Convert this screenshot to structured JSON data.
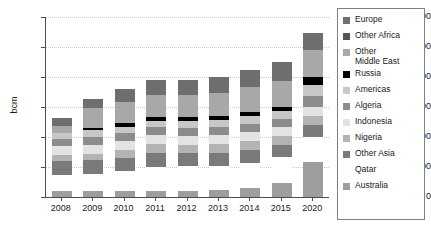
{
  "chart_data": {
    "type": "bar",
    "title": "",
    "xlabel": "",
    "ylabel": "bcm",
    "ylim": [
      0,
      600
    ],
    "ytick_values": [
      0,
      100,
      200,
      300,
      400,
      500,
      600
    ],
    "ytick_labels": [
      "0",
      "100",
      "200",
      "300",
      "400",
      "500",
      "600"
    ],
    "grid": true,
    "stacked": true,
    "legend_position": "right",
    "categories": [
      "2008",
      "2009",
      "2010",
      "2011",
      "2012",
      "2013",
      "2014",
      "2015",
      "2020"
    ],
    "series": [
      {
        "name": "Australia",
        "color": "#9e9e9e",
        "values": [
          20,
          20,
          20,
          20,
          20,
          22,
          30,
          48,
          116
        ]
      },
      {
        "name": "Qatar",
        "color": "#ffffff",
        "values": [
          55,
          58,
          66,
          80,
          82,
          82,
          84,
          84,
          84
        ]
      },
      {
        "name": "Other Asia",
        "color": "#7a7a7a",
        "values": [
          44,
          44,
          45,
          46,
          45,
          44,
          42,
          40,
          40
        ]
      },
      {
        "name": "Nigeria",
        "color": "#b3b3b3",
        "values": [
          22,
          22,
          26,
          30,
          28,
          28,
          30,
          30,
          30
        ]
      },
      {
        "name": "Indonesia",
        "color": "#e3e3e3",
        "values": [
          28,
          30,
          30,
          30,
          30,
          30,
          30,
          30,
          30
        ]
      },
      {
        "name": "Algeria",
        "color": "#8c8c8c",
        "values": [
          24,
          26,
          26,
          26,
          26,
          26,
          28,
          28,
          38
        ]
      },
      {
        "name": "Americas",
        "color": "#c7c7c7",
        "values": [
          20,
          22,
          22,
          22,
          22,
          24,
          26,
          26,
          36
        ]
      },
      {
        "name": "Russia",
        "color": "#000000",
        "values": [
          0,
          8,
          12,
          14,
          14,
          14,
          14,
          14,
          26
        ]
      },
      {
        "name": "Other Middle East",
        "color": "#a8a8a8",
        "values": [
          24,
          68,
          70,
          72,
          72,
          76,
          82,
          88,
          90
        ]
      },
      {
        "name": "Europe",
        "color": "#6e6e6e",
        "values": [
          26,
          30,
          42,
          50,
          52,
          54,
          58,
          62,
          57
        ]
      }
    ],
    "totals": [
      263,
      328,
      359,
      390,
      391,
      400,
      424,
      450,
      547
    ]
  },
  "legend": {
    "entries": [
      {
        "label": "Europe",
        "color": "#6e6e6e"
      },
      {
        "label": "Other Africa",
        "color": "#555555"
      },
      {
        "label": "Other\nMiddle East",
        "color": "#a8a8a8"
      },
      {
        "label": "Russia",
        "color": "#000000"
      },
      {
        "label": "Americas",
        "color": "#c7c7c7"
      },
      {
        "label": "Algeria",
        "color": "#8c8c8c"
      },
      {
        "label": "Indonesia",
        "color": "#e3e3e3"
      },
      {
        "label": "Nigeria",
        "color": "#b3b3b3"
      },
      {
        "label": "Other Asia",
        "color": "#7a7a7a"
      },
      {
        "label": "Qatar",
        "color": "#ffffff"
      },
      {
        "label": "Australia",
        "color": "#9e9e9e"
      }
    ]
  },
  "axis": {
    "y_title": "bcm",
    "axis_color": "#4d4d4d",
    "grid_color": "#c9c9c9"
  }
}
